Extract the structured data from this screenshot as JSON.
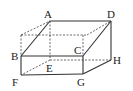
{
  "diagram": {
    "type": "cuboid",
    "labels": {
      "A": "A",
      "B": "B",
      "C": "C",
      "D": "D",
      "E": "E",
      "F": "F",
      "G": "G",
      "H": "H"
    },
    "colors": {
      "line": "#333333",
      "background": "#ffffff"
    }
  }
}
